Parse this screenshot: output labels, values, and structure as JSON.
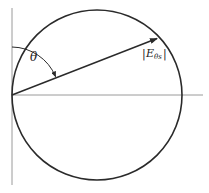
{
  "diagram": {
    "type": "polar-radiation-pattern",
    "labels": {
      "angle": "θ",
      "vector_bar_left": "|",
      "vector_main": "E",
      "vector_sub": "θs",
      "vector_bar_right": "|"
    },
    "geometry": {
      "origin": [
        12,
        95
      ],
      "circle_center": [
        97,
        95
      ],
      "circle_radius": 85,
      "vector_tip": [
        158,
        38
      ],
      "vertical_axis": [
        [
          12,
          8
        ],
        [
          12,
          185
        ]
      ],
      "horizontal_axis": [
        [
          12,
          95
        ],
        [
          203,
          95
        ]
      ]
    },
    "colors": {
      "axis": "#9a9a9a",
      "circle": "#2a2a2a",
      "vector": "#2a2a2a",
      "text": "#222222"
    }
  }
}
